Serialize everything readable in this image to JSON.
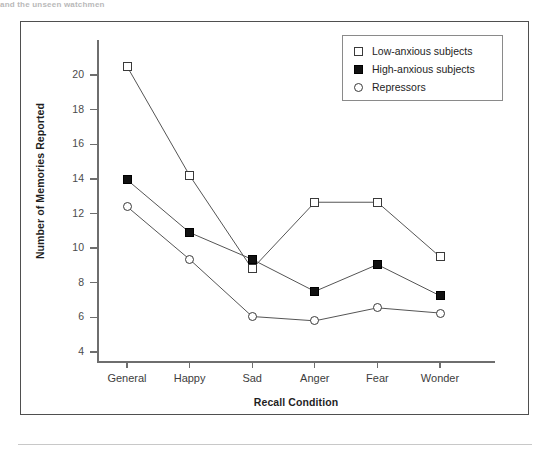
{
  "top_caption": "and the unseen watchmen",
  "chart_data": {
    "type": "line",
    "title": "",
    "xlabel": "Recall Condition",
    "ylabel": "Number of Memories Reported",
    "categories": [
      "General",
      "Happy",
      "Sad",
      "Anger",
      "Fear",
      "Wonder"
    ],
    "ylim": [
      3,
      21
    ],
    "yticks": [
      4,
      6,
      8,
      10,
      12,
      14,
      16,
      18,
      20
    ],
    "ytick_labels": [
      "4",
      "6",
      "8",
      "10",
      "12",
      "14",
      "16",
      "18",
      "20"
    ],
    "grid": false,
    "legend_position": "top-right",
    "series": [
      {
        "name": "Low-anxious subjects",
        "marker": "square-open",
        "values": [
          20.5,
          14.2,
          8.8,
          12.65,
          12.65,
          9.5
        ]
      },
      {
        "name": "High-anxious subjects",
        "marker": "square-filled",
        "values": [
          13.95,
          10.9,
          9.35,
          7.5,
          9.05,
          7.25
        ]
      },
      {
        "name": "Repressors",
        "marker": "circle-open",
        "values": [
          12.4,
          9.35,
          6.05,
          5.8,
          6.55,
          6.25
        ]
      }
    ],
    "colors": {
      "line": "#555555",
      "marker_edge": "#3a3a3a",
      "marker_fill": "#111111",
      "axis": "#6e6e6e",
      "frame": "#4f4f4f",
      "background": "#ffffff"
    }
  }
}
